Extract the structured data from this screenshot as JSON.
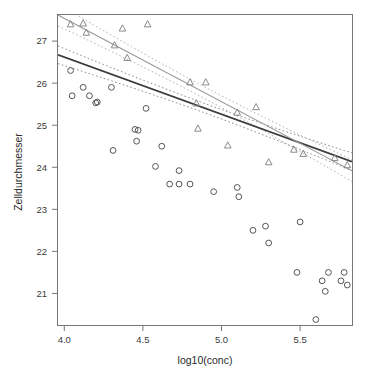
{
  "chart_data": {
    "type": "scatter",
    "title": "",
    "xlabel": "log10(conc)",
    "ylabel": "Zelldurchmesser",
    "xlim": [
      3.96,
      5.83
    ],
    "ylim": [
      20.25,
      27.62
    ],
    "xticks": [
      4.0,
      4.5,
      5.0,
      5.5
    ],
    "xticklabels": [
      "4.0",
      "4.5",
      "5.0",
      "5.5"
    ],
    "yticks": [
      21,
      22,
      23,
      24,
      25,
      26,
      27
    ],
    "yticklabels": [
      "21",
      "22",
      "23",
      "24",
      "25",
      "26",
      "27"
    ],
    "grid": false,
    "legend": "none",
    "series": [
      {
        "name": "group-circle",
        "marker": "circle",
        "color": "#555555",
        "points": [
          {
            "x": 4.04,
            "y": 26.3
          },
          {
            "x": 4.05,
            "y": 25.7
          },
          {
            "x": 4.12,
            "y": 25.9
          },
          {
            "x": 4.16,
            "y": 25.7
          },
          {
            "x": 4.2,
            "y": 25.53
          },
          {
            "x": 4.21,
            "y": 25.55
          },
          {
            "x": 4.3,
            "y": 25.9
          },
          {
            "x": 4.31,
            "y": 24.4
          },
          {
            "x": 4.45,
            "y": 24.9
          },
          {
            "x": 4.47,
            "y": 24.88
          },
          {
            "x": 4.46,
            "y": 24.62
          },
          {
            "x": 4.52,
            "y": 25.4
          },
          {
            "x": 4.58,
            "y": 24.02
          },
          {
            "x": 4.62,
            "y": 24.5
          },
          {
            "x": 4.67,
            "y": 23.6
          },
          {
            "x": 4.73,
            "y": 23.6
          },
          {
            "x": 4.73,
            "y": 23.92
          },
          {
            "x": 4.8,
            "y": 23.6
          },
          {
            "x": 4.95,
            "y": 23.42
          },
          {
            "x": 5.1,
            "y": 23.52
          },
          {
            "x": 5.11,
            "y": 23.3
          },
          {
            "x": 5.2,
            "y": 22.5
          },
          {
            "x": 5.28,
            "y": 22.6
          },
          {
            "x": 5.3,
            "y": 22.2
          },
          {
            "x": 5.48,
            "y": 21.5
          },
          {
            "x": 5.5,
            "y": 22.7
          },
          {
            "x": 5.6,
            "y": 20.38
          },
          {
            "x": 5.64,
            "y": 21.3
          },
          {
            "x": 5.66,
            "y": 21.05
          },
          {
            "x": 5.68,
            "y": 21.5
          },
          {
            "x": 5.76,
            "y": 21.3
          },
          {
            "x": 5.78,
            "y": 21.5
          },
          {
            "x": 5.8,
            "y": 21.2
          }
        ],
        "fit": {
          "intercept": 32.06,
          "slope": -1.36,
          "style": "solid",
          "color": "#3c3c3c"
        },
        "band_offset": 0.105
      },
      {
        "name": "group-triangle",
        "marker": "triangle",
        "color": "#8a8a8a",
        "points": [
          {
            "x": 4.04,
            "y": 27.4
          },
          {
            "x": 4.12,
            "y": 27.42
          },
          {
            "x": 4.14,
            "y": 27.2
          },
          {
            "x": 4.32,
            "y": 26.9
          },
          {
            "x": 4.37,
            "y": 27.3
          },
          {
            "x": 4.4,
            "y": 26.6
          },
          {
            "x": 4.53,
            "y": 27.4
          },
          {
            "x": 4.8,
            "y": 26.02
          },
          {
            "x": 4.84,
            "y": 25.52
          },
          {
            "x": 4.85,
            "y": 24.92
          },
          {
            "x": 4.9,
            "y": 26.02
          },
          {
            "x": 5.04,
            "y": 24.52
          },
          {
            "x": 5.1,
            "y": 25.3
          },
          {
            "x": 5.22,
            "y": 25.43
          },
          {
            "x": 5.3,
            "y": 24.12
          },
          {
            "x": 5.46,
            "y": 24.42
          },
          {
            "x": 5.52,
            "y": 24.32
          },
          {
            "x": 5.72,
            "y": 24.22
          },
          {
            "x": 5.8,
            "y": 24.05
          }
        ],
        "fit": {
          "intercept": 35.46,
          "slope": -1.98,
          "style": "solid",
          "color": "#9a9a9a"
        },
        "band_offset": 0.13
      }
    ],
    "annotations": []
  },
  "axes": {
    "x_axis_label": "log10(conc)",
    "y_axis_label": "Zelldurchmesser"
  },
  "style": {
    "background": "#ffffff",
    "frame_color": "#777777",
    "tick_color": "#3a3a3a",
    "circle_series_color": "#555555",
    "triangle_series_color": "#8a8a8a",
    "circle_fit_color": "#3c3c3c",
    "triangle_fit_color": "#9a9a9a",
    "band_color_dark": "#8e8e8e",
    "band_color_light": "#b4b4b4"
  }
}
